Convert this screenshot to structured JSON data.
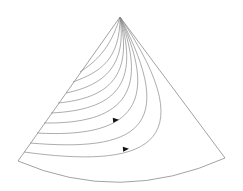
{
  "diagram": {
    "type": "sector-flow-lines",
    "apex": [
      120,
      17
    ],
    "left_corner": [
      18,
      161
    ],
    "right_corner": [
      225,
      158
    ],
    "bottom_arc_control": [
      120,
      205
    ],
    "colors": {
      "line": "#8a8a8a",
      "boundary": "#7a7a7a",
      "arrow": "#111111",
      "background": "#ffffff"
    },
    "curves": [
      {
        "d": "M 80 72 C 95 62, 110 50, 120 17"
      },
      {
        "d": "M 73 82 C 100 72, 120 60, 120 17"
      },
      {
        "d": "M 66 93 C 105 85, 127 65, 120 17"
      },
      {
        "d": "M 58 103 C 110 98, 133 75, 120 17"
      },
      {
        "d": "M 51 113 C 115 110, 140 85, 120 17"
      },
      {
        "d": "M 44 123 C 120 124, 150 95, 120 17"
      },
      {
        "d": "M 37 133 C 125 138, 163 110, 120 17"
      },
      {
        "d": "M 30 143 C 135 152, 180 130, 120 17"
      },
      {
        "d": "M 24 152 C 140 168, 210 150, 120 17"
      }
    ],
    "arrows": [
      {
        "x": 116,
        "y": 120,
        "angle": -5
      },
      {
        "x": 126,
        "y": 149,
        "angle": -5
      }
    ]
  }
}
